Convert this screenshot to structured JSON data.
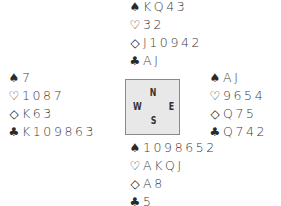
{
  "suit_symbols": {
    "spades": "♠",
    "hearts": "♡",
    "diamonds": "◇",
    "clubs": "♣"
  },
  "compass": {
    "north": "N",
    "south": "S",
    "east": "E",
    "west": "W"
  },
  "hands": {
    "north": {
      "spades": "KQ43",
      "hearts": "32",
      "diamonds": "J10942",
      "clubs": "AJ"
    },
    "west": {
      "spades": "7",
      "hearts": "1087",
      "diamonds": "K63",
      "clubs": "K109863"
    },
    "east": {
      "spades": "AJ",
      "hearts": "9654",
      "diamonds": "Q75",
      "clubs": "Q742"
    },
    "south": {
      "spades": "1098652",
      "hearts": "AKQJ",
      "diamonds": "A8",
      "clubs": "5"
    }
  }
}
